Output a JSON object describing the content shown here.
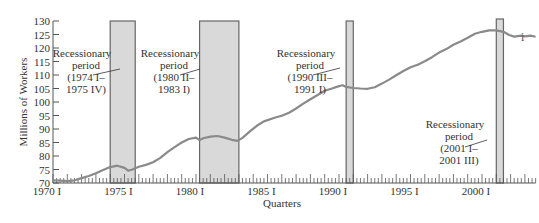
{
  "chart_data": {
    "type": "line",
    "title": "",
    "xlabel": "Quarters",
    "ylabel": "Millions of Workers",
    "ylim": [
      70,
      130
    ],
    "y_ticks": [
      70,
      75,
      80,
      85,
      90,
      95,
      100,
      105,
      110,
      115,
      120,
      125,
      130
    ],
    "x_tick_labels": [
      "1970 I",
      "1975 I",
      "1980 I",
      "1985 I",
      "1990 I",
      "1995 I",
      "2000 I"
    ],
    "x_range_years": [
      1970.0,
      2003.75
    ],
    "grid": false,
    "legend": null,
    "series": [
      {
        "name": "Employment",
        "color": "#8a8a8a",
        "points": [
          [
            1970.0,
            71.0
          ],
          [
            1970.5,
            70.9
          ],
          [
            1971.0,
            70.7
          ],
          [
            1971.5,
            71.0
          ],
          [
            1972.0,
            71.8
          ],
          [
            1972.5,
            72.6
          ],
          [
            1973.0,
            73.6
          ],
          [
            1973.5,
            74.8
          ],
          [
            1974.0,
            75.9
          ],
          [
            1974.5,
            76.4
          ],
          [
            1975.0,
            75.6
          ],
          [
            1975.25,
            74.6
          ],
          [
            1975.5,
            74.9
          ],
          [
            1976.0,
            76.0
          ],
          [
            1976.5,
            76.7
          ],
          [
            1977.0,
            77.7
          ],
          [
            1977.5,
            79.3
          ],
          [
            1978.0,
            81.4
          ],
          [
            1978.5,
            83.3
          ],
          [
            1979.0,
            85.0
          ],
          [
            1979.5,
            86.3
          ],
          [
            1980.0,
            86.8
          ],
          [
            1980.25,
            85.9
          ],
          [
            1980.5,
            86.6
          ],
          [
            1981.0,
            87.2
          ],
          [
            1981.5,
            87.4
          ],
          [
            1982.0,
            86.8
          ],
          [
            1982.5,
            86.0
          ],
          [
            1982.9,
            85.6
          ],
          [
            1983.25,
            86.7
          ],
          [
            1983.75,
            89.0
          ],
          [
            1984.25,
            91.2
          ],
          [
            1984.75,
            92.8
          ],
          [
            1985.5,
            94.2
          ],
          [
            1986.0,
            94.9
          ],
          [
            1986.5,
            96.0
          ],
          [
            1987.0,
            97.6
          ],
          [
            1987.5,
            99.4
          ],
          [
            1988.0,
            101.0
          ],
          [
            1988.5,
            102.6
          ],
          [
            1989.0,
            104.2
          ],
          [
            1989.5,
            105.0
          ],
          [
            1990.0,
            105.9
          ],
          [
            1990.25,
            106.2
          ],
          [
            1990.5,
            105.6
          ],
          [
            1991.0,
            105.2
          ],
          [
            1991.5,
            105.0
          ],
          [
            1992.0,
            104.9
          ],
          [
            1992.5,
            105.5
          ],
          [
            1993.0,
            106.8
          ],
          [
            1993.5,
            108.3
          ],
          [
            1994.0,
            109.9
          ],
          [
            1994.5,
            111.5
          ],
          [
            1995.0,
            112.9
          ],
          [
            1995.5,
            113.8
          ],
          [
            1996.0,
            115.1
          ],
          [
            1996.5,
            116.6
          ],
          [
            1997.0,
            118.3
          ],
          [
            1997.5,
            119.6
          ],
          [
            1998.0,
            121.2
          ],
          [
            1998.5,
            122.4
          ],
          [
            1999.0,
            123.8
          ],
          [
            1999.5,
            125.3
          ],
          [
            2000.0,
            126.0
          ],
          [
            2000.5,
            126.5
          ],
          [
            2001.0,
            126.5
          ],
          [
            2001.5,
            126.0
          ],
          [
            2001.9,
            124.8
          ],
          [
            2002.25,
            124.2
          ],
          [
            2002.75,
            124.6
          ],
          [
            2003.0,
            124.3
          ],
          [
            2003.4,
            124.6
          ],
          [
            2003.75,
            124.2
          ]
        ]
      }
    ],
    "recession_bands": [
      {
        "start": 1974.0,
        "end": 1975.75,
        "label_lines": [
          "Recessionary",
          "period",
          "(1974 I–",
          "1975 IV)"
        ]
      },
      {
        "start": 1980.25,
        "end": 1983.0,
        "label_lines": [
          "Recessionary",
          "period",
          "(1980 II–",
          "1983 I)"
        ]
      },
      {
        "start": 1990.5,
        "end": 1991.0,
        "label_lines": [
          "Recessionary",
          "period",
          "(1990 III–",
          "1991 I)"
        ]
      },
      {
        "start": 2001.0,
        "end": 2001.5,
        "label_lines": [
          "Recessionary",
          "period",
          "(2001 I–",
          "2001 III)"
        ]
      }
    ],
    "band_color": "#d9d9d9",
    "band_border": "#666666"
  },
  "side_mark": "i"
}
